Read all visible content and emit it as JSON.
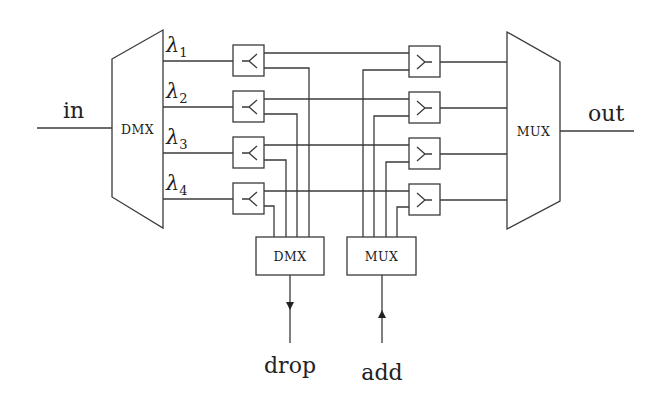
{
  "diagram": {
    "type": "optical add-drop multiplexer (OADM) block diagram",
    "labels": {
      "input": "in",
      "output": "out",
      "drop": "drop",
      "add": "add"
    },
    "demux_main": {
      "label": "DMX"
    },
    "mux_main": {
      "label": "MUX"
    },
    "drop_demux": {
      "label": "DMX"
    },
    "add_mux": {
      "label": "MUX"
    },
    "wavelengths": [
      {
        "symbol": "λ",
        "sub": "1"
      },
      {
        "symbol": "λ",
        "sub": "2"
      },
      {
        "symbol": "λ",
        "sub": "3"
      },
      {
        "symbol": "λ",
        "sub": "4"
      }
    ],
    "drop_switches": [
      {
        "glyph": "⤙",
        "name": "drop-switch-1"
      },
      {
        "glyph": "⤙",
        "name": "drop-switch-2"
      },
      {
        "glyph": "⤙",
        "name": "drop-switch-3"
      },
      {
        "glyph": "⤙",
        "name": "drop-switch-4"
      }
    ],
    "add_switches": [
      {
        "name": "add-switch-1"
      },
      {
        "name": "add-switch-2"
      },
      {
        "name": "add-switch-3"
      },
      {
        "name": "add-switch-4"
      }
    ],
    "colors": {
      "line": "#3a3a3a",
      "text": "#222222",
      "background": "#ffffff"
    }
  }
}
